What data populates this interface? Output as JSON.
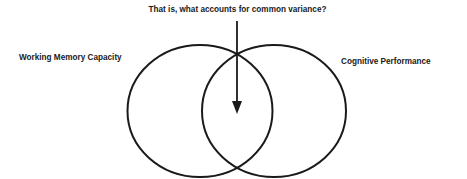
{
  "diagram": {
    "question": "That is, what accounts for common variance?",
    "left_set": {
      "label": "Working Memory Capacity"
    },
    "right_set": {
      "label": "Cognitive Performance"
    },
    "arrow": {
      "points_to": "overlap"
    },
    "colors": {
      "stroke": "#1a1a1a",
      "background": "#ffffff"
    }
  }
}
